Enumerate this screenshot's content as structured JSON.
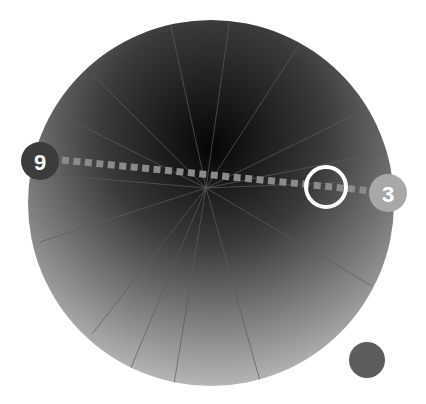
{
  "wheel": {
    "segment_count": 15,
    "colors": {
      "dark": "#050505",
      "mid": "#3a3a3a",
      "light": "#ececec",
      "divider": "#5c5c5c"
    }
  },
  "markers": {
    "start": {
      "label": "9",
      "color": "#3c3c3c"
    },
    "end": {
      "label": "3",
      "color": "#a8a8a8"
    }
  },
  "connector": {
    "style": "dashed",
    "color": "#8a8a8a"
  },
  "selector_ring": {
    "color": "#ffffff"
  },
  "swatch": {
    "color": "#5c5c5c"
  }
}
